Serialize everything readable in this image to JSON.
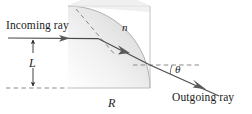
{
  "figure": {
    "labels": {
      "incoming_ray": "Incoming ray",
      "outgoing_ray": "Outgoing ray",
      "height_L": "L",
      "radius_R": "R",
      "refractive_index_n": "n",
      "angle_theta": "θ"
    },
    "colors": {
      "line": "#3c3c3c",
      "dashed": "#7a7a7a",
      "text": "#1c1c1c",
      "glass_fill_light": "#fbfbfb",
      "glass_fill_mid": "#e8e8e8",
      "glass_fill_dark": "#c9c9c9",
      "glass_edge": "#b5b5b5",
      "background": "#ffffff"
    },
    "geometry": {
      "arc_center_x": 68,
      "arc_center_y": 88,
      "arc_radius": 82,
      "flat_right_x": 150,
      "flat_bottom_y": 88,
      "incoming_ray_y": 38,
      "incoming_ray_start_x": 8,
      "entry_point_x": 98,
      "entry_point_y": 39,
      "exit_point_x": 150,
      "exit_point_y": 65,
      "outgoing_end_x": 219,
      "outgoing_end_y": 96,
      "dimension_line_x": 33
    }
  }
}
